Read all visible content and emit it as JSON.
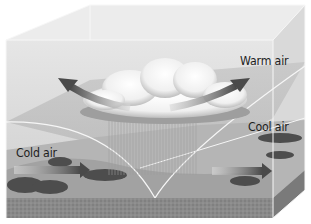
{
  "figure": {
    "labels": {
      "warm_air": "Warm air",
      "cool_air": "Cool air",
      "cold_air": "Cold air"
    },
    "elements": {
      "cloud": "cumulonimbus cloud with rain",
      "arrows": [
        {
          "name": "warm-air-rising-left",
          "direction": "up-left"
        },
        {
          "name": "warm-air-rising-right",
          "direction": "up-right"
        },
        {
          "name": "cold-air-advancing",
          "direction": "right"
        },
        {
          "name": "cool-air-retreating",
          "direction": "right"
        }
      ]
    },
    "colors": {
      "sky": "#dcdcdc",
      "box_edge": "#f4f4f4",
      "arrow": "#5a5a5a",
      "ground": "#8c8c8c",
      "text": "#1e1e1e"
    }
  }
}
